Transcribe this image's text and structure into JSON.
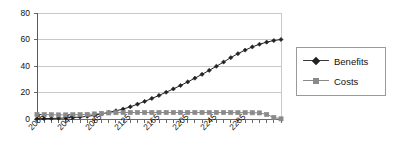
{
  "chart_data": {
    "type": "line",
    "title": "",
    "xlabel": "",
    "ylabel": "",
    "xlim": [
      2005,
      2345
    ],
    "ylim": [
      0,
      80
    ],
    "yticks": [
      0,
      20,
      40,
      60,
      80
    ],
    "xtick_labels": [
      "2005",
      "2045",
      "2085",
      "2125",
      "2165",
      "2205",
      "2245",
      "2285"
    ],
    "xtick_values": [
      2005,
      2045,
      2085,
      2125,
      2165,
      2205,
      2245,
      2285
    ],
    "x_step": 10,
    "grid": "horizontal",
    "legend_position": "right",
    "x": [
      2005,
      2015,
      2025,
      2035,
      2045,
      2055,
      2065,
      2075,
      2085,
      2095,
      2105,
      2115,
      2125,
      2135,
      2145,
      2155,
      2165,
      2175,
      2185,
      2195,
      2205,
      2215,
      2225,
      2235,
      2245,
      2255,
      2265,
      2275,
      2285,
      2295,
      2305,
      2315,
      2325,
      2335,
      2345
    ],
    "series": [
      {
        "name": "Benefits",
        "color": "#222222",
        "marker": "diamond",
        "values": [
          0.2,
          0.3,
          0.4,
          0.6,
          0.8,
          1.1,
          1.5,
          2.0,
          2.8,
          3.8,
          5.0,
          6.2,
          7.5,
          9.2,
          11.2,
          13.3,
          15.5,
          17.8,
          20.2,
          22.7,
          25.3,
          28.0,
          30.8,
          33.7,
          36.7,
          39.8,
          43.0,
          46.3,
          49.3,
          52.0,
          54.4,
          56.4,
          58.0,
          59.2,
          60.0
        ]
      },
      {
        "name": "Costs",
        "color": "#8a8a8a",
        "marker": "square",
        "values": [
          3.4,
          3.3,
          3.2,
          3.1,
          3.1,
          3.2,
          3.3,
          3.5,
          3.8,
          4.2,
          4.6,
          4.8,
          4.9,
          4.9,
          4.9,
          4.9,
          4.9,
          4.9,
          4.9,
          4.9,
          4.9,
          4.9,
          4.9,
          4.9,
          4.9,
          4.9,
          4.9,
          4.9,
          4.8,
          4.8,
          4.7,
          4.6,
          3.4,
          1.2,
          0.1
        ]
      }
    ]
  },
  "legend": {
    "items": [
      {
        "label": "Benefits"
      },
      {
        "label": "Costs"
      }
    ]
  }
}
